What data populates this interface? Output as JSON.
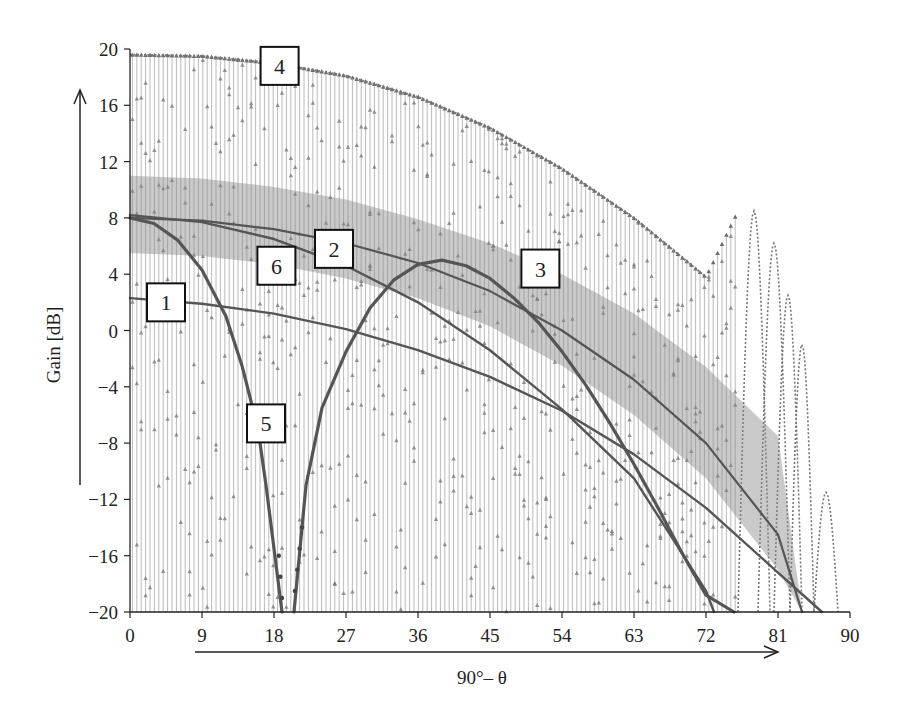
{
  "chart_data": {
    "type": "line",
    "title": "",
    "xlabel": "90°– θ",
    "ylabel": "Gain [dB]",
    "xlim": [
      0,
      90
    ],
    "ylim": [
      -20,
      20
    ],
    "x_ticks": [
      0,
      9,
      18,
      27,
      36,
      45,
      54,
      63,
      72,
      81,
      90
    ],
    "y_ticks": [
      20,
      16,
      12,
      8,
      4,
      0,
      -4,
      -8,
      -12,
      -16,
      -20
    ],
    "x_tick_labels": [
      "0",
      "9",
      "18",
      "27",
      "36",
      "45",
      "54",
      "63",
      "72",
      "81",
      "90"
    ],
    "y_tick_labels": [
      "20",
      "16",
      "12",
      "8",
      "4",
      "0",
      "−4",
      "−8",
      "−12",
      "−16",
      "−20"
    ],
    "grid": false,
    "legend": "none (numbered callout boxes 1–6)",
    "series": [
      {
        "name": "1",
        "style": "smooth solid line",
        "x": [
          0,
          9,
          18,
          27,
          36,
          45,
          54,
          63,
          72,
          81,
          86.5
        ],
        "y": [
          2.3,
          1.9,
          1.2,
          0.1,
          -1.4,
          -3.3,
          -5.7,
          -8.8,
          -12.6,
          -17.2,
          -20
        ]
      },
      {
        "name": "2",
        "style": "dense oscillating stems with marker envelope",
        "x": [
          0,
          9,
          18,
          27,
          36,
          45,
          54,
          63,
          72,
          81,
          84
        ],
        "y": [
          8.0,
          7.8,
          7.2,
          6.2,
          4.8,
          2.8,
          0.0,
          -3.5,
          -8.0,
          -14.5,
          -20
        ]
      },
      {
        "name": "3",
        "style": "smooth solid line",
        "x": [
          20.5,
          22,
          24,
          27,
          30,
          33,
          36,
          39,
          42,
          45,
          48,
          51,
          54,
          57,
          60,
          63,
          66,
          69,
          72,
          75.5
        ],
        "y": [
          -20,
          -11,
          -5.5,
          -1.5,
          1.6,
          3.6,
          4.7,
          5.0,
          4.6,
          3.7,
          2.3,
          0.6,
          -1.5,
          -3.9,
          -6.6,
          -9.5,
          -12.6,
          -15.8,
          -18.8,
          -20
        ]
      },
      {
        "name": "4",
        "style": "dense oscillating stems with triangle markers (upper envelope)",
        "x": [
          0,
          9,
          18,
          27,
          36,
          45,
          54,
          63,
          72,
          76,
          79,
          82,
          85,
          87,
          89
        ],
        "y": [
          19.6,
          19.5,
          19.0,
          18.1,
          16.6,
          14.4,
          11.5,
          8.0,
          3.8,
          8.5,
          6.2,
          2.5,
          -1.0,
          -11.5,
          -11.5
        ]
      },
      {
        "name": "5",
        "style": "smooth solid line with dot markers near null",
        "x": [
          0,
          3,
          6,
          9,
          12,
          14,
          16,
          17,
          18,
          19
        ],
        "y": [
          8.0,
          7.6,
          6.4,
          4.3,
          1.0,
          -2.5,
          -7.0,
          -11.0,
          -15.5,
          -20
        ]
      },
      {
        "name": "6",
        "style": "smooth solid line",
        "x": [
          0,
          9,
          18,
          27,
          36,
          45,
          54,
          63,
          72,
          73
        ],
        "y": [
          8.2,
          7.7,
          6.5,
          4.6,
          2.0,
          -1.4,
          -5.6,
          -10.5,
          -18.5,
          -20
        ]
      }
    ],
    "envelope_band": {
      "name": "series 2/6 dense band",
      "x": [
        0,
        9,
        18,
        27,
        36,
        45,
        54,
        63,
        72,
        81
      ],
      "y_top": [
        11.0,
        10.8,
        10.2,
        9.3,
        7.9,
        6.2,
        4.0,
        1.2,
        -2.6,
        -7.5
      ]
    },
    "callouts": [
      {
        "label": "1",
        "x": 4.5,
        "y": 2.0
      },
      {
        "label": "2",
        "x": 25.5,
        "y": 5.8
      },
      {
        "label": "3",
        "x": 51.3,
        "y": 4.4
      },
      {
        "label": "4",
        "x": 18.7,
        "y": 18.8
      },
      {
        "label": "5",
        "x": 17.0,
        "y": -6.6
      },
      {
        "label": "6",
        "x": 18.3,
        "y": 4.6
      }
    ]
  },
  "colors": {
    "axis": "#222222",
    "stems": "#9a9a9a",
    "curve": "#555555",
    "markers": "#6e6e6e"
  },
  "layout": {
    "plot_left": 130,
    "plot_right": 850,
    "plot_top": 49,
    "plot_bottom": 612,
    "y_arrow": {
      "x": 80,
      "y_top": 90,
      "y_bottom": 485
    },
    "x_arrow": {
      "y": 652,
      "x_left": 195,
      "x_right": 778
    }
  }
}
